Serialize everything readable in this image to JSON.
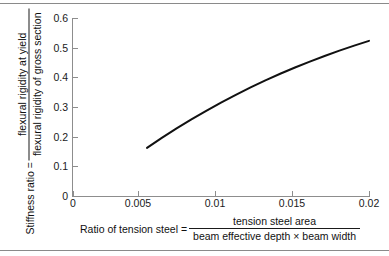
{
  "chart_data": {
    "type": "line",
    "title": "",
    "xlabel_parts": {
      "lead": "Ratio of tension steel =",
      "numerator": "tension steel area",
      "denominator": "beam effective depth × beam width"
    },
    "ylabel_parts": {
      "lead": "Stiffness ratio =",
      "numerator": "flexural rigidity at yield",
      "denominator": "flexural rigidity of gross section"
    },
    "xlim": [
      0,
      0.02
    ],
    "ylim": [
      0,
      0.6
    ],
    "xticks": [
      0,
      0.005,
      0.01,
      0.015,
      0.02
    ],
    "xticklabels": [
      "0",
      "0.005",
      "0.01",
      "0.015",
      "0.02"
    ],
    "yticks": [
      0,
      0.1,
      0.2,
      0.3,
      0.4,
      0.5,
      0.6
    ],
    "yticklabels": [
      "0",
      "0.1",
      "0.2",
      "0.3",
      "0.4",
      "0.5",
      "0.6"
    ],
    "grid": false,
    "legend": false,
    "series": [
      {
        "name": "stiffness ratio vs tension steel ratio",
        "color": "#111111",
        "linewidth": 2,
        "x": [
          0.005,
          0.006,
          0.007,
          0.008,
          0.009,
          0.01,
          0.011,
          0.012,
          0.013,
          0.014,
          0.015,
          0.016,
          0.017,
          0.018,
          0.019,
          0.02
        ],
        "y": [
          0.162,
          0.196,
          0.228,
          0.258,
          0.287,
          0.315,
          0.341,
          0.366,
          0.39,
          0.412,
          0.433,
          0.453,
          0.472,
          0.49,
          0.507,
          0.523
        ]
      }
    ]
  }
}
